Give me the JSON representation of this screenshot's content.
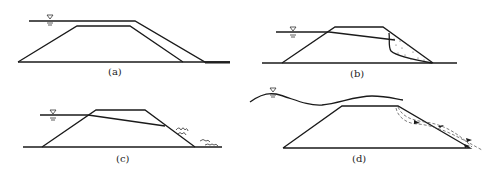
{
  "figure": {
    "panels": [
      {
        "id": "a",
        "label": "(a)",
        "description": "overtopping: water level above dam crest flowing over downstream slope"
      },
      {
        "id": "b",
        "label": "(b)",
        "description": "downstream slope sliding along seepage line (dotted slip mass)"
      },
      {
        "id": "c",
        "label": "(c)",
        "description": "piping / seepage exit on downstream slope and toe"
      },
      {
        "id": "d",
        "label": "(d)",
        "description": "wave action overtopping with flow arrows along downstream slope"
      }
    ],
    "water_symbol": "▽",
    "colors": {
      "line": "#1a1a1a",
      "background": "#ffffff"
    }
  }
}
